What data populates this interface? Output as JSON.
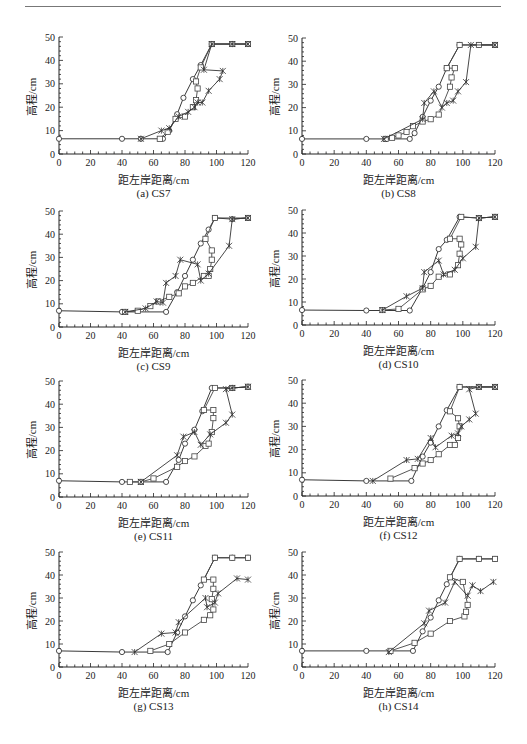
{
  "page": {
    "header_rule": true
  },
  "axis_common": {
    "xlabel": "距左岸距离/cm",
    "ylabel": "高程/cm",
    "x_ticks": [
      "0",
      "20",
      "40",
      "60",
      "80",
      "100",
      "120"
    ],
    "y_ticks": [
      "0",
      "10",
      "20",
      "30",
      "40",
      "50"
    ]
  },
  "series_styles": [
    {
      "name": "series-diamond",
      "marker": "diamond",
      "color": "#222222"
    },
    {
      "name": "series-square",
      "marker": "square",
      "color": "#444444"
    },
    {
      "name": "series-star",
      "marker": "star",
      "color": "#333333"
    }
  ],
  "panels": [
    {
      "caption": "(a)  CS7"
    },
    {
      "caption": "(b)  CS8"
    },
    {
      "caption": "(c)  CS9"
    },
    {
      "caption": "(d)  CS10"
    },
    {
      "caption": "(e)  CS11"
    },
    {
      "caption": "(f)  CS12"
    },
    {
      "caption": "(g)  CS13"
    },
    {
      "caption": "(h)  CS14"
    }
  ],
  "chart_data": [
    {
      "type": "line",
      "title": "(a) CS7",
      "xlabel": "距左岸距离/cm",
      "ylabel": "高程/cm",
      "xlim": [
        0,
        120
      ],
      "ylim": [
        0,
        50
      ],
      "grid": false,
      "legend": "none",
      "series": [
        {
          "name": "diamond",
          "x": [
            0,
            40,
            52,
            66,
            70,
            75,
            79,
            85,
            90,
            97,
            110,
            120
          ],
          "y": [
            6.5,
            6.5,
            6.5,
            6.5,
            10,
            17,
            24,
            32,
            38,
            47,
            47,
            47
          ]
        },
        {
          "name": "square",
          "x": [
            64,
            69,
            74,
            80,
            85,
            87,
            88,
            87,
            90,
            97,
            110,
            120
          ],
          "y": [
            6.5,
            9.5,
            15,
            16,
            20,
            23,
            28,
            31,
            37,
            47,
            47,
            47
          ]
        },
        {
          "name": "star",
          "x": [
            52,
            65,
            70,
            76,
            82,
            86,
            88,
            91,
            95,
            102,
            104,
            92,
            97,
            110,
            120
          ],
          "y": [
            6.5,
            10,
            11,
            16,
            18,
            20,
            22,
            22,
            27,
            32,
            35.5,
            36,
            47,
            47,
            47
          ]
        }
      ]
    },
    {
      "type": "line",
      "title": "(b) CS8",
      "xlabel": "距左岸距离/cm",
      "ylabel": "高程/cm",
      "xlim": [
        0,
        120
      ],
      "ylim": [
        0,
        50
      ],
      "grid": false,
      "legend": "none",
      "series": [
        {
          "name": "diamond",
          "x": [
            0,
            40,
            52,
            67,
            70,
            75,
            80,
            85,
            90,
            98,
            110,
            120
          ],
          "y": [
            6.5,
            6.5,
            6.5,
            6.5,
            9,
            16,
            23,
            29,
            37,
            47,
            47,
            47
          ]
        },
        {
          "name": "square",
          "x": [
            52,
            56,
            60,
            65,
            69,
            75,
            80,
            85,
            92,
            93,
            95,
            90,
            98,
            110,
            120
          ],
          "y": [
            6.5,
            7,
            8,
            9.5,
            12,
            14,
            15,
            17,
            29,
            33,
            37,
            37,
            47,
            47,
            47
          ]
        },
        {
          "name": "star",
          "x": [
            51,
            75,
            76,
            82,
            87,
            90,
            94,
            97,
            102,
            105,
            120
          ],
          "y": [
            6.5,
            15,
            22,
            27,
            20,
            22,
            23,
            27,
            31,
            47,
            47
          ]
        }
      ]
    },
    {
      "type": "line",
      "title": "(c) CS9",
      "xlabel": "距左岸距离/cm",
      "ylabel": "高程/cm",
      "xlim": [
        0,
        120
      ],
      "ylim": [
        0,
        50
      ],
      "grid": false,
      "legend": "none",
      "series": [
        {
          "name": "diamond",
          "x": [
            0,
            40,
            68,
            75,
            80,
            85,
            90,
            95,
            99,
            110,
            120
          ],
          "y": [
            7,
            6.5,
            6.5,
            15,
            22,
            29,
            36,
            42,
            47,
            46.5,
            47
          ]
        },
        {
          "name": "square",
          "x": [
            42,
            50,
            58,
            63,
            70,
            76,
            80,
            85,
            92,
            95,
            96,
            97,
            97,
            93,
            99,
            120
          ],
          "y": [
            6.5,
            7,
            9,
            11,
            13,
            14.5,
            17.5,
            19,
            22,
            22,
            25,
            29,
            33,
            38,
            47,
            47
          ]
        },
        {
          "name": "star",
          "x": [
            42,
            55,
            62,
            66,
            68,
            74,
            77,
            88,
            90,
            95,
            108,
            110,
            120
          ],
          "y": [
            6.5,
            8,
            11,
            10.5,
            19,
            22,
            29,
            27,
            20,
            23,
            35,
            46.5,
            47
          ]
        }
      ]
    },
    {
      "type": "line",
      "title": "(d) CS10",
      "xlabel": "距左岸距离/cm",
      "ylabel": "高程/cm",
      "xlim": [
        0,
        120
      ],
      "ylim": [
        0,
        50
      ],
      "grid": false,
      "legend": "none",
      "series": [
        {
          "name": "diamond",
          "x": [
            0,
            40,
            67,
            75,
            80,
            85,
            90,
            98,
            110,
            120
          ],
          "y": [
            6.5,
            6.3,
            6.3,
            16,
            23,
            33,
            37,
            47,
            46.5,
            47
          ]
        },
        {
          "name": "square",
          "x": [
            50,
            60,
            75,
            80,
            85,
            92,
            97,
            98,
            99,
            98,
            92,
            99,
            110,
            120
          ],
          "y": [
            6.5,
            7,
            15.5,
            17,
            21,
            22,
            26,
            31,
            35,
            37.5,
            37.5,
            47,
            46.5,
            47
          ]
        },
        {
          "name": "star",
          "x": [
            50,
            65,
            75,
            76,
            85,
            88,
            95,
            100,
            108,
            110,
            120
          ],
          "y": [
            6.5,
            12.5,
            16,
            23,
            28,
            22,
            24,
            29,
            34,
            46.5,
            47
          ]
        }
      ]
    },
    {
      "type": "line",
      "title": "(e) CS11",
      "xlabel": "距左岸距离/cm",
      "ylabel": "高程/cm",
      "xlim": [
        0,
        120
      ],
      "ylim": [
        0,
        50
      ],
      "grid": false,
      "legend": "none",
      "series": [
        {
          "name": "diamond",
          "x": [
            0,
            40,
            68,
            76,
            80,
            86,
            91,
            97,
            110,
            120
          ],
          "y": [
            7,
            6.5,
            6.5,
            16,
            23,
            29,
            37,
            47,
            47,
            47.5
          ]
        },
        {
          "name": "square",
          "x": [
            45,
            52,
            60,
            75,
            80,
            86,
            93,
            95,
            97,
            98,
            98,
            92,
            99,
            110,
            120
          ],
          "y": [
            6.5,
            6.5,
            8,
            13,
            15.5,
            17.5,
            22,
            23,
            28,
            34,
            37.5,
            37.5,
            47,
            47,
            47.5
          ]
        },
        {
          "name": "star",
          "x": [
            52,
            75,
            79,
            86,
            90,
            96,
            106,
            110,
            106,
            110,
            120
          ],
          "y": [
            6.5,
            18,
            26,
            28,
            22.5,
            27,
            32,
            35.5,
            46.5,
            47,
            47.5
          ]
        }
      ]
    },
    {
      "type": "line",
      "title": "(f) CS12",
      "xlabel": "距左岸距离/cm",
      "ylabel": "高程/cm",
      "xlim": [
        0,
        120
      ],
      "ylim": [
        0,
        50
      ],
      "grid": false,
      "legend": "none",
      "series": [
        {
          "name": "diamond",
          "x": [
            0,
            40,
            68,
            75,
            80,
            85,
            90,
            98,
            110,
            120
          ],
          "y": [
            7,
            6.5,
            6.5,
            17,
            23,
            30,
            37,
            47,
            47,
            47
          ]
        },
        {
          "name": "square",
          "x": [
            55,
            70,
            75,
            80,
            85,
            92,
            95,
            97,
            98,
            97,
            92,
            98,
            110,
            120
          ],
          "y": [
            7.5,
            12,
            14,
            15.5,
            18,
            22,
            22,
            25,
            30,
            33.5,
            36.5,
            47,
            47,
            47
          ]
        },
        {
          "name": "star",
          "x": [
            44,
            65,
            72,
            80,
            83,
            93,
            97,
            99,
            104,
            108,
            104,
            110,
            120
          ],
          "y": [
            6.5,
            15.5,
            16,
            25,
            21,
            26,
            27,
            30,
            33,
            35.5,
            46,
            47,
            47
          ]
        }
      ]
    },
    {
      "type": "line",
      "title": "(g) CS13",
      "xlabel": "距左岸距离/cm",
      "ylabel": "高程/cm",
      "xlim": [
        0,
        120
      ],
      "ylim": [
        0,
        50
      ],
      "grid": false,
      "legend": "none",
      "series": [
        {
          "name": "diamond",
          "x": [
            0,
            40,
            69,
            75,
            80,
            85,
            90,
            99,
            110,
            120
          ],
          "y": [
            7,
            6.5,
            6.5,
            15,
            22,
            29,
            35.5,
            47.5,
            47.5,
            47.5
          ]
        },
        {
          "name": "square",
          "x": [
            58,
            70,
            80,
            92,
            96,
            98,
            97,
            98,
            98,
            92,
            99,
            110,
            120
          ],
          "y": [
            7,
            10,
            15,
            20.5,
            22.5,
            25,
            29.5,
            34,
            38,
            38,
            47.5,
            47.5,
            47.5
          ]
        },
        {
          "name": "star",
          "x": [
            48,
            65,
            74,
            76,
            93,
            94,
            99,
            101,
            113,
            120
          ],
          "y": [
            6.5,
            14.5,
            15,
            19.5,
            30,
            26,
            28,
            32,
            38.5,
            38
          ]
        }
      ]
    },
    {
      "type": "line",
      "title": "(h) CS14",
      "xlabel": "距左岸距离/cm",
      "ylabel": "高程/cm",
      "xlim": [
        0,
        120
      ],
      "ylim": [
        0,
        50
      ],
      "grid": false,
      "legend": "none",
      "series": [
        {
          "name": "diamond",
          "x": [
            0,
            40,
            69,
            75,
            80,
            85,
            90,
            98,
            110,
            120
          ],
          "y": [
            7,
            7,
            7,
            15.5,
            21.5,
            29,
            36,
            47,
            47,
            47
          ]
        },
        {
          "name": "square",
          "x": [
            55,
            70,
            80,
            92,
            101,
            102,
            103,
            100,
            92,
            98,
            110,
            120
          ],
          "y": [
            7,
            10.5,
            14.5,
            20,
            22,
            24,
            27,
            37,
            39,
            47,
            47,
            47
          ]
        },
        {
          "name": "star",
          "x": [
            54,
            76,
            79,
            89,
            95,
            103,
            106,
            111,
            119
          ],
          "y": [
            6.5,
            19,
            24.5,
            28,
            37,
            31,
            35.5,
            33,
            37
          ]
        }
      ]
    }
  ]
}
